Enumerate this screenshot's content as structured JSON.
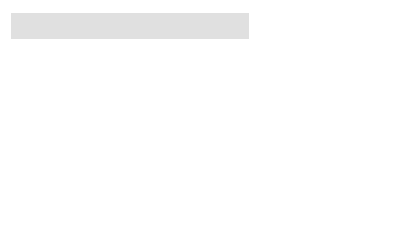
{
  "title": {
    "label": "Four-fourths"
  },
  "top_bar": {
    "segments": 4
  },
  "colors": {
    "dark": "#7b7b7b",
    "light": "#a9a9a9",
    "top": "#b1b1b1"
  },
  "left_column": [
    {
      "per_group": 2,
      "total": 6
    },
    {
      "per_group": 3,
      "total": 9
    },
    {
      "per_group": 4,
      "total": 12
    },
    {
      "per_group": 5,
      "total": 15
    },
    {
      "per_group": 6,
      "total": 18
    }
  ],
  "right_column": [
    {
      "per_group": 7,
      "total": 21
    },
    {
      "per_group": 8,
      "total": 24
    },
    {
      "per_group": 9,
      "total": 27
    },
    {
      "per_group": 10,
      "total": 30
    },
    {
      "per_group": 11,
      "total": 33
    }
  ]
}
